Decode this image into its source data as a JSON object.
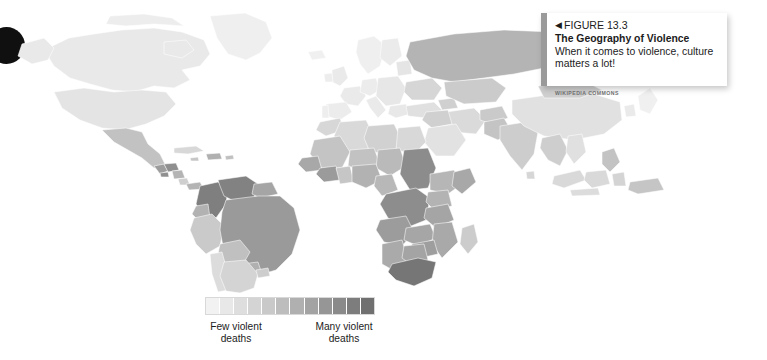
{
  "figure": {
    "arrow_icon": "◀",
    "number": "FIGURE 13.3",
    "headline": "The Geography of Violence",
    "caption": "When it comes to violence, culture matters a lot!",
    "credit": "WIKIPEDIA COMMONS",
    "accent_color": "#9a9a9a"
  },
  "legend": {
    "low_label": "Few violent\ndeaths",
    "low_label_line1": "Few violent",
    "low_label_line2": "deaths",
    "high_label_line1": "Many violent",
    "high_label_line2": "deaths",
    "swatch_colors": [
      "#f2f2f2",
      "#e8e8e8",
      "#dedede",
      "#d4d4d4",
      "#c9c9c9",
      "#bdbdbd",
      "#b0b0b0",
      "#a3a3a3",
      "#969696",
      "#8a8a8a",
      "#7d7d7d",
      "#707070"
    ],
    "steps": 12
  },
  "map": {
    "title": "World choropleth of violent deaths",
    "projection": "equirectangular",
    "background": "#ffffff",
    "border_color": "#ffffff",
    "no_data_color": "#fbfbfb"
  },
  "chart_data": {
    "type": "map",
    "title": "The Geography of Violence",
    "subtitle": "When it comes to violence, culture matters a lot!",
    "value_label": "Violent deaths (homicide rate)",
    "scale_low_label": "Few violent deaths",
    "scale_high_label": "Many violent deaths",
    "legend_position": "bottom-center",
    "color_scale": [
      "#f2f2f2",
      "#e8e8e8",
      "#dedede",
      "#d4d4d4",
      "#c9c9c9",
      "#bdbdbd",
      "#b0b0b0",
      "#a3a3a3",
      "#969696",
      "#8a8a8a",
      "#7d7d7d",
      "#707070"
    ],
    "regions": [
      {
        "name": "Canada",
        "level": 1,
        "color": "#e9e9e9"
      },
      {
        "name": "United States",
        "level": 2,
        "color": "#e4e4e4"
      },
      {
        "name": "Greenland",
        "level": 0,
        "color": "#efefef"
      },
      {
        "name": "Mexico",
        "level": 5,
        "color": "#c2c2c2"
      },
      {
        "name": "Guatemala",
        "level": 8,
        "color": "#9d9d9d"
      },
      {
        "name": "Honduras",
        "level": 9,
        "color": "#8f8f8f"
      },
      {
        "name": "El Salvador",
        "level": 9,
        "color": "#8f8f8f"
      },
      {
        "name": "Nicaragua",
        "level": 6,
        "color": "#b4b4b4"
      },
      {
        "name": "Costa Rica",
        "level": 4,
        "color": "#cfcfcf"
      },
      {
        "name": "Panama",
        "level": 6,
        "color": "#b4b4b4"
      },
      {
        "name": "Cuba",
        "level": 3,
        "color": "#d8d8d8"
      },
      {
        "name": "Colombia",
        "level": 10,
        "color": "#7f7f7f"
      },
      {
        "name": "Venezuela",
        "level": 10,
        "color": "#828282"
      },
      {
        "name": "Ecuador",
        "level": 6,
        "color": "#b2b2b2"
      },
      {
        "name": "Peru",
        "level": 4,
        "color": "#cacaca"
      },
      {
        "name": "Brazil",
        "level": 8,
        "color": "#9a9a9a"
      },
      {
        "name": "Bolivia",
        "level": 5,
        "color": "#c0c0c0"
      },
      {
        "name": "Chile",
        "level": 2,
        "color": "#dcdcdc"
      },
      {
        "name": "Argentina",
        "level": 3,
        "color": "#d4d4d4"
      },
      {
        "name": "Paraguay",
        "level": 6,
        "color": "#b0b0b0"
      },
      {
        "name": "Uruguay",
        "level": 4,
        "color": "#cdcdcd"
      },
      {
        "name": "United Kingdom",
        "level": 1,
        "color": "#eaeaea"
      },
      {
        "name": "France",
        "level": 1,
        "color": "#eaeaea"
      },
      {
        "name": "Spain",
        "level": 1,
        "color": "#ececec"
      },
      {
        "name": "Germany",
        "level": 1,
        "color": "#ececec"
      },
      {
        "name": "Italy",
        "level": 1,
        "color": "#eaeaea"
      },
      {
        "name": "Poland",
        "level": 1,
        "color": "#e7e7e7"
      },
      {
        "name": "Norway",
        "level": 0,
        "color": "#efefef"
      },
      {
        "name": "Sweden",
        "level": 0,
        "color": "#efefef"
      },
      {
        "name": "Finland",
        "level": 1,
        "color": "#ebebeb"
      },
      {
        "name": "Ukraine",
        "level": 3,
        "color": "#d6d6d6"
      },
      {
        "name": "Russia",
        "level": 6,
        "color": "#b4b4b4"
      },
      {
        "name": "Kazakhstan",
        "level": 4,
        "color": "#cbcbcb"
      },
      {
        "name": "Turkey",
        "level": 2,
        "color": "#e0e0e0"
      },
      {
        "name": "Iran",
        "level": 3,
        "color": "#dadada"
      },
      {
        "name": "Iraq",
        "level": 4,
        "color": "#d0d0d0"
      },
      {
        "name": "Saudi Arabia",
        "level": 2,
        "color": "#e2e2e2"
      },
      {
        "name": "India",
        "level": 4,
        "color": "#cdcdcd"
      },
      {
        "name": "Pakistan",
        "level": 5,
        "color": "#c4c4c4"
      },
      {
        "name": "China",
        "level": 2,
        "color": "#e1e1e1"
      },
      {
        "name": "Mongolia",
        "level": 4,
        "color": "#cfcfcf"
      },
      {
        "name": "Japan",
        "level": 0,
        "color": "#f0f0f0"
      },
      {
        "name": "South Korea",
        "level": 1,
        "color": "#eaeaea"
      },
      {
        "name": "Indonesia",
        "level": 3,
        "color": "#d9d9d9"
      },
      {
        "name": "Philippines",
        "level": 5,
        "color": "#c3c3c3"
      },
      {
        "name": "Thailand",
        "level": 4,
        "color": "#cecece"
      },
      {
        "name": "Vietnam",
        "level": 2,
        "color": "#e0e0e0"
      },
      {
        "name": "Australia",
        "level": 1,
        "color": "#ebebeb"
      },
      {
        "name": "New Zealand",
        "level": 1,
        "color": "#ebebeb"
      },
      {
        "name": "Papua New Guinea",
        "level": 5,
        "color": "#c5c5c5"
      },
      {
        "name": "Morocco",
        "level": 3,
        "color": "#d7d7d7"
      },
      {
        "name": "Algeria",
        "level": 3,
        "color": "#d9d9d9"
      },
      {
        "name": "Libya",
        "level": 4,
        "color": "#d1d1d1"
      },
      {
        "name": "Egypt",
        "level": 3,
        "color": "#d8d8d8"
      },
      {
        "name": "Sudan",
        "level": 9,
        "color": "#8c8c8c"
      },
      {
        "name": "Ethiopia",
        "level": 6,
        "color": "#b6b6b6"
      },
      {
        "name": "Somalia",
        "level": 7,
        "color": "#a8a8a8"
      },
      {
        "name": "Kenya",
        "level": 6,
        "color": "#b3b3b3"
      },
      {
        "name": "Tanzania",
        "level": 7,
        "color": "#a5a5a5"
      },
      {
        "name": "Nigeria",
        "level": 6,
        "color": "#b2b2b2"
      },
      {
        "name": "Niger",
        "level": 5,
        "color": "#c2c2c2"
      },
      {
        "name": "Mali",
        "level": 5,
        "color": "#c4c4c4"
      },
      {
        "name": "Chad",
        "level": 6,
        "color": "#bababa"
      },
      {
        "name": "Ivory Coast",
        "level": 8,
        "color": "#9b9b9b"
      },
      {
        "name": "Ghana",
        "level": 5,
        "color": "#c6c6c6"
      },
      {
        "name": "Cameroon",
        "level": 6,
        "color": "#b8b8b8"
      },
      {
        "name": "DR Congo",
        "level": 9,
        "color": "#8d8d8d"
      },
      {
        "name": "Angola",
        "level": 8,
        "color": "#9c9c9c"
      },
      {
        "name": "Zambia",
        "level": 7,
        "color": "#a6a6a6"
      },
      {
        "name": "Zimbabwe",
        "level": 8,
        "color": "#9e9e9e"
      },
      {
        "name": "Mozambique",
        "level": 7,
        "color": "#a9a9a9"
      },
      {
        "name": "Namibia",
        "level": 7,
        "color": "#aaaaaa"
      },
      {
        "name": "Botswana",
        "level": 7,
        "color": "#a4a4a4"
      },
      {
        "name": "South Africa",
        "level": 11,
        "color": "#767676"
      },
      {
        "name": "Madagascar",
        "level": 4,
        "color": "#cccccc"
      }
    ]
  }
}
